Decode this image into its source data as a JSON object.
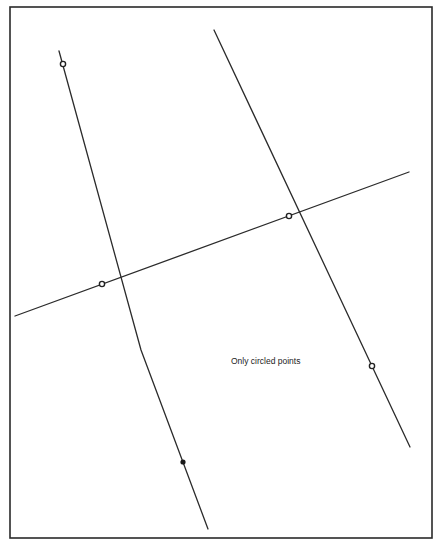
{
  "figure": {
    "frame": {
      "x": 10,
      "y": 7,
      "width": 422,
      "height": 531
    },
    "label": {
      "text": "Only circled points",
      "x": 231,
      "y": 364
    },
    "lines": [
      {
        "name": "left-bent-line",
        "points": [
          [
            59,
            51
          ],
          [
            141,
            350
          ],
          [
            208,
            529
          ]
        ]
      },
      {
        "name": "right-line",
        "points": [
          [
            214,
            30
          ],
          [
            410,
            447
          ]
        ]
      },
      {
        "name": "crossing-line",
        "points": [
          [
            15,
            316
          ],
          [
            409,
            172
          ]
        ]
      }
    ],
    "circled_points": [
      {
        "x": 63,
        "y": 64
      },
      {
        "x": 102,
        "y": 284
      },
      {
        "x": 289,
        "y": 216
      },
      {
        "x": 372,
        "y": 366
      }
    ],
    "solid_points": [
      {
        "x": 183,
        "y": 462
      }
    ],
    "colors": {
      "stroke": "#2b2b2b",
      "background": "#ffffff"
    }
  }
}
